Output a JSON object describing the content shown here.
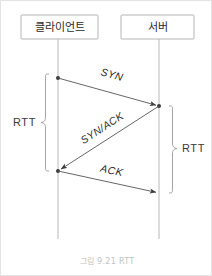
{
  "figure": {
    "caption": "그림 9.21 RTT",
    "width": 212,
    "height": 276,
    "background": "#ffffff",
    "border_color": "#e3e3e3"
  },
  "participants": [
    {
      "id": "client",
      "label": "클라이언트",
      "lifeline_x": 57,
      "box": {
        "x": 20,
        "y": 14,
        "width": 77,
        "height": 24
      }
    },
    {
      "id": "server",
      "label": "서버",
      "lifeline_x": 158,
      "box": {
        "x": 120,
        "y": 14,
        "width": 73,
        "height": 24
      }
    }
  ],
  "lifeline": {
    "top": 38,
    "bottom": 238,
    "color": "#b8b8b8"
  },
  "messages": [
    {
      "label": "SYN",
      "from": "client",
      "to": "server",
      "x1": 57,
      "y1": 77,
      "x2": 158,
      "y2": 105,
      "label_x": 110,
      "label_y": 77,
      "label_rotate": 15.5
    },
    {
      "label": "SYN/ACK",
      "from": "server",
      "to": "client",
      "x1": 158,
      "y1": 105,
      "x2": 57,
      "y2": 170,
      "label_x": 103,
      "label_y": 130,
      "label_rotate": -32.8
    },
    {
      "label": "ACK",
      "from": "client",
      "to": "server",
      "x1": 57,
      "y1": 170,
      "x2": 158,
      "y2": 192,
      "label_x": 110,
      "label_y": 173,
      "label_rotate": 12.3
    }
  ],
  "braces": [
    {
      "id": "rtt-left",
      "label": "RTT",
      "side": "left",
      "x": 44,
      "top": 73,
      "bottom": 170,
      "label_x": 12,
      "label_y": 122
    },
    {
      "id": "rtt-right",
      "label": "RTT",
      "side": "right",
      "x": 172,
      "top": 105,
      "bottom": 192,
      "label_x": 180,
      "label_y": 148
    }
  ],
  "colors": {
    "box_stroke": "#b5b5b5",
    "lifeline": "#b8b8b8",
    "arrow": "#555555",
    "brace": "#9a9a9a",
    "text": "#2b2b2b",
    "caption": "#c2c2c2"
  },
  "caption_position": {
    "x": 106,
    "y": 262
  }
}
